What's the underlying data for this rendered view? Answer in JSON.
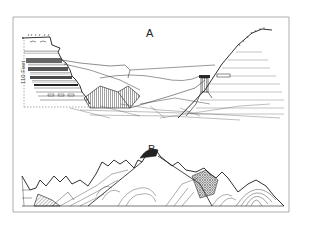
{
  "figure": {
    "colors": {
      "ink": "#1a1a1a",
      "frame": "#8a8a8a",
      "paper": "#ffffff"
    },
    "panels": [
      {
        "id": "A",
        "label": "A",
        "subject": "canyon cliff with horizontal strata, distant mesa, rock pillar and slope",
        "scale_label": "110 Feet"
      },
      {
        "id": "B",
        "label": "B",
        "subject": "cross-section of folded and faulted mountain range"
      }
    ]
  }
}
